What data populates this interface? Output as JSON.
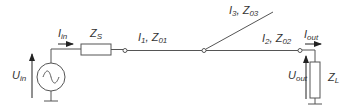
{
  "diagram": {
    "type": "circuit",
    "colors": {
      "stroke": "#555555",
      "text": "#333333",
      "background": "#ffffff"
    },
    "labels": {
      "i_in": {
        "main": "I",
        "sub": "in"
      },
      "u_in": {
        "main": "U",
        "sub": "in"
      },
      "z_s": {
        "main": "Z",
        "sub": "S"
      },
      "line1_i": {
        "main": "I",
        "sub": "1"
      },
      "line1_z": {
        "main": "Z",
        "sub": "01"
      },
      "line3_i": {
        "main": "I",
        "sub": "3"
      },
      "line3_z": {
        "main": "Z",
        "sub": "03"
      },
      "line2_i": {
        "main": "I",
        "sub": "2"
      },
      "line2_z": {
        "main": "Z",
        "sub": "02"
      },
      "i_out": {
        "main": "I",
        "sub": "out"
      },
      "u_out": {
        "main": "U",
        "sub": "out"
      },
      "z_l": {
        "main": "Z",
        "sub": "L"
      },
      "sep": ", "
    },
    "components": [
      {
        "id": "source",
        "kind": "ac-voltage-source",
        "symbol": "~"
      },
      {
        "id": "Z_S",
        "kind": "impedance"
      },
      {
        "id": "line1",
        "kind": "transmission-line",
        "label": "I1, Z01"
      },
      {
        "id": "line2",
        "kind": "transmission-line",
        "label": "I2, Z02"
      },
      {
        "id": "line3",
        "kind": "transmission-line",
        "label": "I3, Z03"
      },
      {
        "id": "Z_L",
        "kind": "impedance"
      }
    ]
  }
}
